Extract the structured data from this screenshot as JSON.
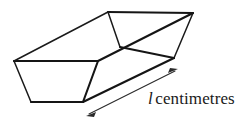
{
  "figure": {
    "type": "geometry-diagram",
    "background_color": "#ffffff",
    "line_color": "#1a1a1a",
    "dimension_color": "#2a2a2a",
    "label": {
      "symbol": "l",
      "symbol_style": "italic",
      "unit_text": "centimetres",
      "full_text": "l centimetres"
    },
    "dimension_arrow": {
      "style": "double-headed",
      "from_x": 87,
      "from_y": 115,
      "to_x": 177,
      "to_y": 70
    },
    "vertices": {
      "near_top_left": "14,61",
      "near_top_right": "98,61",
      "near_bottom_right": "83,102",
      "near_bottom_left": "31,102",
      "far_top_left": "108,12",
      "far_top_right": "193,13",
      "far_bottom_left": "120,47",
      "far_bottom_right": "174,58"
    }
  }
}
